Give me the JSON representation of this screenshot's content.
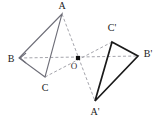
{
  "figure": {
    "background_color": "#ffffff",
    "width": 159,
    "height": 119,
    "center_point": {
      "name": "O",
      "label": "O",
      "x": 78,
      "y": 58,
      "label_x": 74,
      "label_y": 69,
      "marker": "filled-square-dot",
      "color": "#111111"
    },
    "colors": {
      "source_triangle_stroke": "#6e6e78",
      "image_triangle_stroke": "#1a1a1a",
      "dashed_stroke": "#9a9aa2",
      "label_text": "#1a1a1a"
    },
    "vertices": [
      {
        "name": "A",
        "label": "A",
        "x": 62,
        "y": 14,
        "label_x": 62,
        "label_y": 9,
        "anchor": "middle"
      },
      {
        "name": "B",
        "label": "B",
        "x": 19,
        "y": 58,
        "label_x": 11,
        "label_y": 62,
        "anchor": "middle"
      },
      {
        "name": "C",
        "label": "C",
        "x": 45,
        "y": 77,
        "label_x": 45,
        "label_y": 91,
        "anchor": "middle"
      },
      {
        "name": "A'",
        "label": "A'",
        "x": 95,
        "y": 101,
        "label_x": 95,
        "label_y": 115,
        "anchor": "middle"
      },
      {
        "name": "B'",
        "label": "B'",
        "x": 138,
        "y": 56,
        "label_x": 148,
        "label_y": 57,
        "anchor": "middle"
      },
      {
        "name": "C'",
        "label": "C'",
        "x": 112,
        "y": 42,
        "label_x": 112,
        "label_y": 31,
        "anchor": "middle"
      }
    ],
    "source_triangle": {
      "name": "triangle-ABC",
      "vertex_labels": [
        "A",
        "B",
        "C"
      ],
      "points": "62,14 19,58 45,77",
      "stroke": "#6e6e78",
      "stroke_width": 1.1,
      "style": "solid"
    },
    "image_triangle": {
      "name": "triangle-A-prime-B-prime-C-prime",
      "vertex_labels": [
        "A'",
        "B'",
        "C'"
      ],
      "points": "95,101 138,56 112,42",
      "stroke": "#1a1a1a",
      "stroke_width": 1.7,
      "style": "solid"
    },
    "connector_lines": [
      {
        "name": "line-A-to-A-prime",
        "from": "A",
        "to": "A'",
        "x1": 62,
        "y1": 14,
        "x2": 95,
        "y2": 101,
        "style": "dashed"
      },
      {
        "name": "line-B-to-B-prime",
        "from": "B",
        "to": "B'",
        "x1": 19,
        "y1": 58,
        "x2": 138,
        "y2": 56,
        "style": "dashed"
      },
      {
        "name": "line-C-to-C-prime",
        "from": "C",
        "to": "C'",
        "x1": 45,
        "y1": 77,
        "x2": 112,
        "y2": 42,
        "style": "dashed"
      }
    ],
    "arrow_marker": {
      "name": "arrowhead-at-B",
      "x": 19,
      "y": 58,
      "direction": "left"
    }
  }
}
